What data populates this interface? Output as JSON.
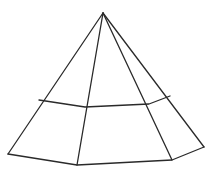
{
  "diagram": {
    "type": "pyramid-line-drawing",
    "stroke_color": "#2a2a2a",
    "background": "#ffffff",
    "apex": [
      103,
      13
    ],
    "mid_ring": [
      [
        39,
        100
      ],
      [
        85,
        107
      ],
      [
        149,
        104
      ],
      [
        170,
        96
      ]
    ],
    "base": [
      [
        8,
        154
      ],
      [
        77,
        165
      ],
      [
        172,
        160
      ],
      [
        204,
        147
      ]
    ]
  }
}
